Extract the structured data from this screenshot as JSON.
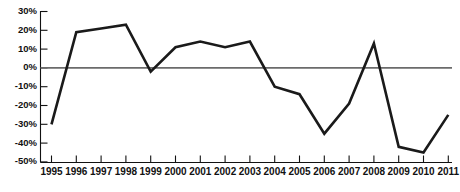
{
  "chart_data": {
    "type": "line",
    "title": "",
    "subtitle": "",
    "xlabel": "",
    "ylabel": "",
    "categories": [
      "1995",
      "1996",
      "1997",
      "1998",
      "1999",
      "2000",
      "2001",
      "2002",
      "2003",
      "2004",
      "2005",
      "2006",
      "2007",
      "2008",
      "2009",
      "2010",
      "2011"
    ],
    "x": [
      1995,
      1996,
      1997,
      1998,
      1999,
      2000,
      2001,
      2002,
      2003,
      2004,
      2005,
      2006,
      2007,
      2008,
      2009,
      2010,
      2011
    ],
    "values": [
      -30,
      19,
      21,
      23,
      -2,
      11,
      14,
      11,
      14,
      -10,
      -14,
      -35,
      -19,
      13,
      -42,
      -45,
      -25
    ],
    "series": [
      {
        "name": "",
        "values": [
          -30,
          19,
          21,
          23,
          -2,
          11,
          14,
          11,
          14,
          -10,
          -14,
          -35,
          -19,
          13,
          -42,
          -45,
          -25
        ]
      }
    ],
    "ylim": [
      -50,
      30
    ],
    "xlim": [
      1995,
      2011
    ],
    "yticks": [
      30,
      20,
      10,
      0,
      -10,
      -20,
      -30,
      -40,
      -50
    ],
    "ytick_labels": [
      "30%",
      "20%",
      "10%",
      "0%",
      "-10%",
      "-20%",
      "-30%",
      "-40%",
      "-50%"
    ],
    "xtick_labels": [
      "1995",
      "1996",
      "1997",
      "1998",
      "1999",
      "2000",
      "2001",
      "2002",
      "2003",
      "2004",
      "2005",
      "2006",
      "2007",
      "2008",
      "2009",
      "2010",
      "2011"
    ],
    "grid": false,
    "legend": null,
    "legend_position": "none",
    "annotations": [],
    "colors": {
      "line": "#1a1a1a",
      "axis": "#111111",
      "zero_line": "#6b6b6b",
      "background": "#ffffff",
      "text": "#111111"
    },
    "units": "percent"
  }
}
